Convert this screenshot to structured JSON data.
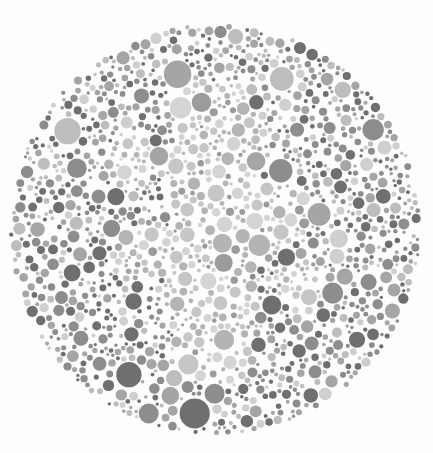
{
  "image": {
    "kind": "ishihara-color-vision-test-plate",
    "description": "Grayscale Ishihara pseudoisochromatic plate composed of densely packed circles of varied size inside a large circular field on a white background.",
    "width": 433,
    "height": 453,
    "background_color": "#fdfdfd"
  },
  "plate": {
    "center_x": 215,
    "center_y": 229,
    "radius": 206,
    "dot_count": 1450,
    "dot_min_radius": 1.6,
    "dot_max_radius": 15.5,
    "edge_padding": 1.0
  },
  "palette": {
    "background_tones": [
      "#6f6f6f",
      "#8d8d8d",
      "#a5a5a5",
      "#bdbdbd",
      "#cfcfcf"
    ],
    "background_weights": [
      26,
      28,
      20,
      16,
      10
    ],
    "figure_tones": [
      "#b4b4b4",
      "#c6c6c6",
      "#d4d4d4",
      "#9b9b9b"
    ],
    "figure_weights": [
      30,
      32,
      24,
      14
    ],
    "dark_accent": "#6b6b6b",
    "mid_accent": "#909090",
    "light_accent": "#c8c8c8"
  },
  "hidden_figure": {
    "visible_to_normal_vision": true,
    "form": "soft lighter-toned vertical band through the middle of the plate",
    "strokes": [
      {
        "type": "blob",
        "x": 215,
        "y": 120,
        "rx": 46,
        "ry": 40
      },
      {
        "type": "blob",
        "x": 210,
        "y": 180,
        "rx": 50,
        "ry": 44
      },
      {
        "type": "blob",
        "x": 218,
        "y": 240,
        "rx": 52,
        "ry": 46
      },
      {
        "type": "blob",
        "x": 208,
        "y": 300,
        "rx": 48,
        "ry": 42
      },
      {
        "type": "blob",
        "x": 214,
        "y": 352,
        "rx": 40,
        "ry": 34
      },
      {
        "type": "blob",
        "x": 150,
        "y": 250,
        "rx": 30,
        "ry": 30
      },
      {
        "type": "blob",
        "x": 278,
        "y": 215,
        "rx": 32,
        "ry": 32
      },
      {
        "type": "blob",
        "x": 300,
        "y": 285,
        "rx": 26,
        "ry": 26
      },
      {
        "type": "blob",
        "x": 132,
        "y": 160,
        "rx": 24,
        "ry": 24
      }
    ]
  },
  "render": {
    "seed": 20240917,
    "packing_attempts": 30000,
    "noise_opacity": 0.05
  },
  "caption": {
    "text": ""
  }
}
